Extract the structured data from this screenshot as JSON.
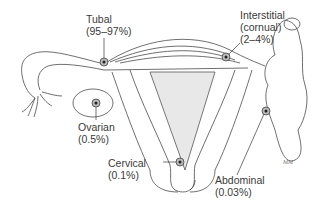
{
  "diagram": {
    "labels": [
      {
        "id": "tubal",
        "name": "Tubal",
        "percent": "(95–97%)"
      },
      {
        "id": "interstitial",
        "name": "Interstitial",
        "name2": "(cornual)",
        "percent": "(2–4%)"
      },
      {
        "id": "ovarian",
        "name": "Ovarian",
        "percent": "(0.5%)"
      },
      {
        "id": "cervical",
        "name": "Cervical",
        "percent": "(0.1%)"
      },
      {
        "id": "abdominal",
        "name": "Abdominal",
        "percent": "(0.03%)"
      }
    ],
    "colors": {
      "line": "#3a3a3a",
      "marker": "#555555",
      "background": "#ffffff"
    }
  }
}
